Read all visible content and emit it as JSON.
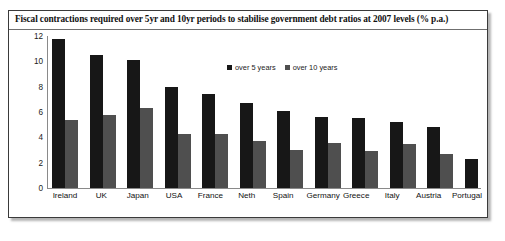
{
  "chart_data": {
    "type": "bar",
    "title": "Fiscal contractions required over 5yr and 10yr periods to stabilise government debt ratios at 2007 levels (% p.a.)",
    "xlabel": "",
    "ylabel": "",
    "ylim": [
      0,
      12
    ],
    "yticks": [
      12,
      10,
      8,
      6,
      4,
      2,
      0
    ],
    "grid": false,
    "legend_position": "top-center",
    "categories": [
      "Ireland",
      "UK",
      "Japan",
      "USA",
      "France",
      "Neth",
      "Spain",
      "Germany",
      "Greece",
      "Italy",
      "Austria",
      "Portugal"
    ],
    "series": [
      {
        "name": "over 5 years",
        "color": "#171717",
        "values": [
          11.8,
          10.5,
          10.1,
          8.0,
          7.4,
          6.7,
          6.1,
          5.6,
          5.5,
          5.25,
          4.85,
          2.3
        ]
      },
      {
        "name": "over 10 years",
        "color": "#4f4f4f",
        "values": [
          5.4,
          5.8,
          6.3,
          4.3,
          4.3,
          3.7,
          3.0,
          3.55,
          2.9,
          3.45,
          2.65,
          null
        ]
      }
    ]
  }
}
